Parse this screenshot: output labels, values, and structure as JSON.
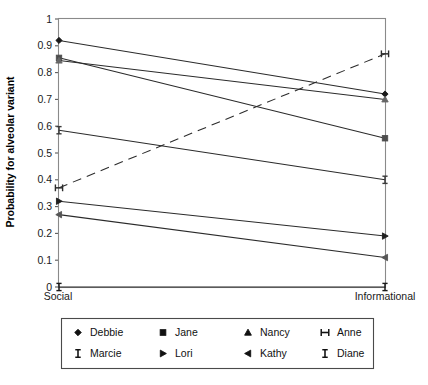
{
  "chart_data": {
    "type": "line",
    "title": "",
    "subtitle": "",
    "xlabel": "",
    "ylabel": "Probability for alveolar variant",
    "categories": [
      "Social",
      "Informational"
    ],
    "x": [
      0,
      1
    ],
    "ylim": [
      0,
      1
    ],
    "xlim": [
      0,
      1
    ],
    "ytick_labels": [
      "0",
      "0.1",
      "0.2",
      "0.3",
      "0.4",
      "0.5",
      "0.6",
      "0.7",
      "0.8",
      "0.9",
      "1"
    ],
    "ytick_values": [
      0,
      0.1,
      0.2,
      0.3,
      0.4,
      0.5,
      0.6,
      0.7,
      0.8,
      0.9,
      1
    ],
    "grid": false,
    "legend_position": "bottom",
    "legend_columns": 4,
    "series": [
      {
        "name": "Debbie",
        "marker": "diamond",
        "linestyle": "solid",
        "color": "#1a1a1a",
        "values": [
          0.92,
          0.72
        ]
      },
      {
        "name": "Jane",
        "marker": "square",
        "linestyle": "solid",
        "color": "#4d4d4d",
        "values": [
          0.855,
          0.555
        ]
      },
      {
        "name": "Nancy",
        "marker": "triangle-up",
        "linestyle": "solid",
        "color": "#666666",
        "values": [
          0.845,
          0.7
        ]
      },
      {
        "name": "Anne",
        "marker": "cross-bar",
        "linestyle": "dashed",
        "color": "#2b2b2b",
        "values": [
          0.37,
          0.87
        ]
      },
      {
        "name": "Marcie",
        "marker": "i-beam",
        "linestyle": "solid",
        "color": "#3a3a3a",
        "values": [
          0.585,
          0.4
        ]
      },
      {
        "name": "Lori",
        "marker": "triangle-right",
        "linestyle": "solid",
        "color": "#1f1f1f",
        "values": [
          0.32,
          0.19
        ]
      },
      {
        "name": "Kathy",
        "marker": "triangle-left",
        "linestyle": "solid",
        "color": "#555555",
        "values": [
          0.27,
          0.11
        ]
      },
      {
        "name": "Diane",
        "marker": "i-beam",
        "linestyle": "solid",
        "color": "#1a1a1a",
        "values": [
          0.0,
          0.0
        ]
      }
    ]
  },
  "axis": {
    "y_title": "Probability for alveolar variant",
    "y_ticks": [
      "1",
      "0.9",
      "0.8",
      "0.7",
      "0.6",
      "0.5",
      "0.4",
      "0.3",
      "0.2",
      "0.1",
      "0"
    ],
    "x_left_label": "Social",
    "x_right_label": "Informational"
  },
  "legend": {
    "rows": [
      [
        {
          "label": "Debbie",
          "marker": "diamond"
        },
        {
          "label": "Jane",
          "marker": "square"
        },
        {
          "label": "Nancy",
          "marker": "triangle-up"
        },
        {
          "label": "Anne",
          "marker": "cross-bar"
        }
      ],
      [
        {
          "label": "Marcie",
          "marker": "i-beam"
        },
        {
          "label": "Lori",
          "marker": "triangle-right"
        },
        {
          "label": "Kathy",
          "marker": "triangle-left"
        },
        {
          "label": "Diane",
          "marker": "i-beam"
        }
      ]
    ]
  },
  "colors": {
    "background": "#ffffff",
    "frame": "#8a8a8a",
    "line": "#2b2b2b",
    "text": "#111111"
  }
}
